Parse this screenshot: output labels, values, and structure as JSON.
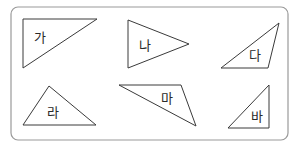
{
  "figure": {
    "frame": {
      "x": 11,
      "y": 7,
      "width": 277,
      "height": 133,
      "radius": 7,
      "stroke": "#9a9a9a"
    },
    "shapes": [
      {
        "label": "가",
        "points": "23,19 97,19 23,68",
        "label_pos": [
          34,
          42
        ]
      },
      {
        "label": "나",
        "points": "128,20 189,44 128,68",
        "label_pos": [
          139,
          50
        ]
      },
      {
        "label": "다",
        "points": "279,23 268,68 221,68",
        "label_pos": [
          249,
          60
        ]
      },
      {
        "label": "라",
        "points": "49,86 96,125 23,125",
        "label_pos": [
          47,
          117
        ]
      },
      {
        "label": "마",
        "points": "119,85 181,85 196,126",
        "label_pos": [
          161,
          103
        ]
      },
      {
        "label": "바",
        "points": "269,85 269,128 228,128",
        "label_pos": [
          251,
          121
        ]
      }
    ]
  }
}
